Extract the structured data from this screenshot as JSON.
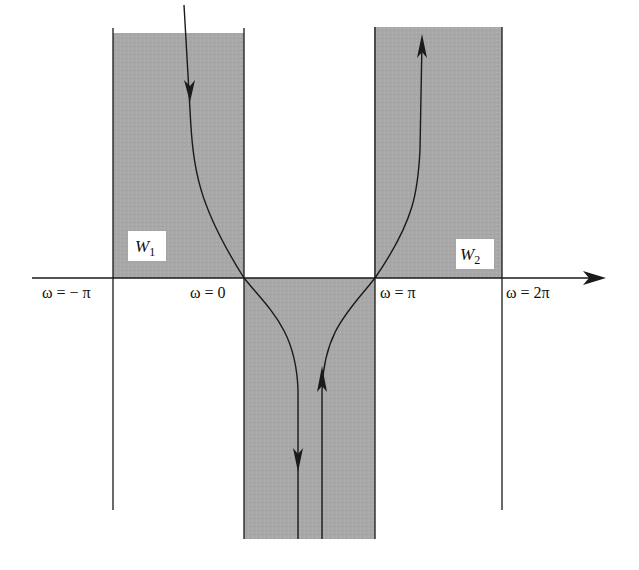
{
  "diagram": {
    "axis": {
      "labels": [
        "ω = − π",
        "ω = 0",
        "ω = π",
        "ω = 2π"
      ]
    },
    "regions": [
      {
        "name": "W",
        "subscript": "1"
      },
      {
        "name": "W",
        "subscript": "2"
      }
    ],
    "colors": {
      "shade": "#a9a9a9",
      "line": "#1a1a1a",
      "label_bg": "#ffffff"
    }
  }
}
